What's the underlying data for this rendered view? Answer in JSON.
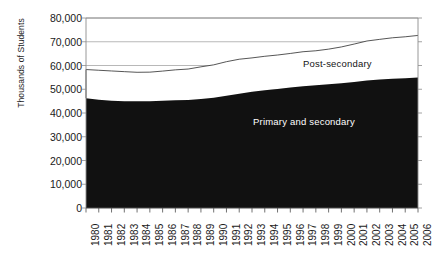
{
  "chart_data": {
    "type": "area",
    "title": "",
    "subtitle": "",
    "xlabel": "",
    "ylabel": "Thousands of Students",
    "stacked": true,
    "grid": true,
    "legend_position": "inline-annotation",
    "xlim": [
      1980,
      2006
    ],
    "ylim": [
      0,
      80000
    ],
    "ytick_labels": [
      "80,000",
      "70,000",
      "60,000",
      "50,000",
      "40,000",
      "30,000",
      "20,000",
      "10,000",
      "0"
    ],
    "ytick_values": [
      80000,
      70000,
      60000,
      50000,
      40000,
      30000,
      20000,
      10000,
      0
    ],
    "categories": [
      "1980",
      "1981",
      "1982",
      "1983",
      "1984",
      "1985",
      "1986",
      "1987",
      "1988",
      "1989",
      "1990",
      "1991",
      "1992",
      "1993",
      "1994",
      "1995",
      "1996",
      "1997",
      "1998",
      "1999",
      "2000",
      "2001",
      "2002",
      "2003",
      "2004",
      "2005",
      "2006"
    ],
    "x": [
      1980,
      1981,
      1982,
      1983,
      1984,
      1985,
      1986,
      1987,
      1988,
      1989,
      1990,
      1991,
      1992,
      1993,
      1994,
      1995,
      1996,
      1997,
      1998,
      1999,
      2000,
      2001,
      2002,
      2003,
      2004,
      2005,
      2006
    ],
    "series": [
      {
        "name": "Primary and secondary",
        "color": "#111111",
        "values": [
          46200,
          45600,
          45200,
          44950,
          44900,
          44950,
          45150,
          45400,
          45450,
          45900,
          46450,
          47250,
          48150,
          48900,
          49600,
          50150,
          50700,
          51300,
          51700,
          52100,
          52500,
          53100,
          53700,
          54100,
          54400,
          54600,
          54900
        ]
      },
      {
        "name": "Post-secondary",
        "color": "#ffffff",
        "values": [
          12100,
          12400,
          12500,
          12460,
          12240,
          12250,
          12500,
          12770,
          13060,
          13540,
          13820,
          14360,
          14490,
          14300,
          14280,
          14260,
          14370,
          14500,
          14500,
          14790,
          15310,
          15930,
          16610,
          16910,
          17270,
          17490,
          17760
        ]
      }
    ],
    "totals": [
      58300,
      58000,
      57700,
      57410,
      57140,
      57200,
      57650,
      58170,
      58510,
      59440,
      60270,
      61610,
      62640,
      63200,
      63880,
      64410,
      65070,
      65800,
      66200,
      66890,
      67810,
      69030,
      70310,
      71010,
      71670,
      72090,
      72660
    ],
    "annotations": [
      {
        "text": "Post-secondary",
        "name": "post-secondary-label"
      },
      {
        "text": "Primary and secondary",
        "name": "primary-secondary-label"
      }
    ]
  },
  "axis": {
    "y_title": "Thousands of Students"
  }
}
